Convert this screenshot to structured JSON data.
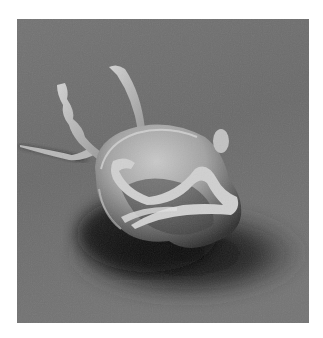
{
  "image": {
    "subject": "Scanning electron micrograph of a flagellated protozoan cell",
    "frame": {
      "x": 17,
      "y": 19,
      "width": 292,
      "height": 304
    },
    "colors": {
      "page_background": "#ffffff",
      "substrate_light": "#7a7a7a",
      "substrate_mid": "#5e5e5e",
      "shadow": "#1a1a1a",
      "cell_body": "#a8a8a8",
      "cell_highlight": "#d6d6d6",
      "flagella": "#c4c4c4"
    }
  }
}
